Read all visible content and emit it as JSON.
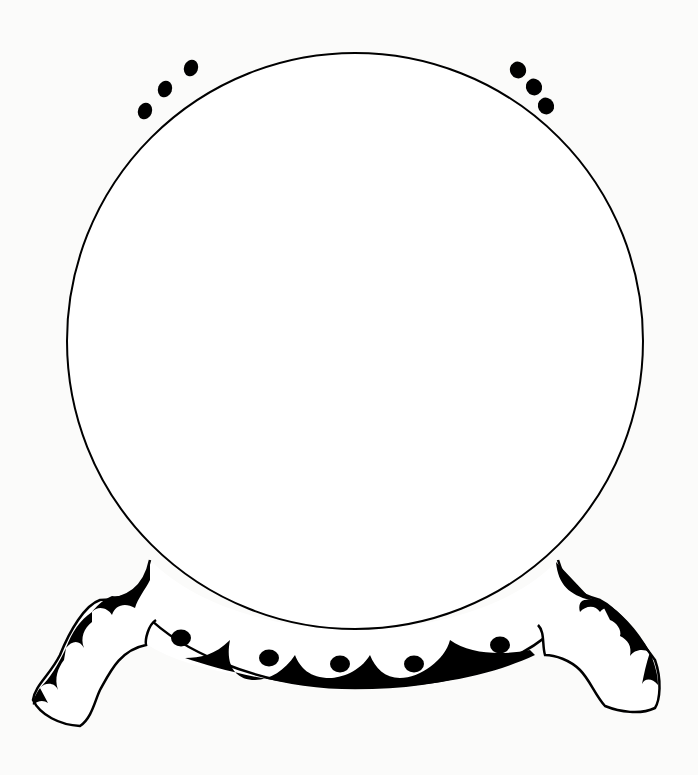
{
  "illustration": {
    "subject": "crystal ball on decorative stand",
    "style": "black ink line drawing",
    "colors": {
      "ink": "#000000",
      "paper": "#fbfbfa"
    },
    "ball": {
      "cx": 355,
      "cy": 341,
      "r": 288
    },
    "sparkle_dots": {
      "left": [
        {
          "cx": 145,
          "cy": 111
        },
        {
          "cx": 165,
          "cy": 89
        },
        {
          "cx": 191,
          "cy": 68
        }
      ],
      "right": [
        {
          "cx": 518,
          "cy": 70
        },
        {
          "cx": 534,
          "cy": 87
        },
        {
          "cx": 546,
          "cy": 106
        }
      ]
    },
    "base_dots": [
      {
        "cx": 181,
        "cy": 638
      },
      {
        "cx": 269,
        "cy": 658
      },
      {
        "cx": 340,
        "cy": 664
      },
      {
        "cx": 414,
        "cy": 664
      },
      {
        "cx": 500,
        "cy": 645
      }
    ]
  }
}
